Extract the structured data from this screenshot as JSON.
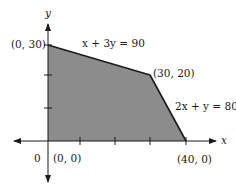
{
  "diagram": {
    "type": "feasible-region",
    "axes": {
      "x_label": "x",
      "y_label": "y",
      "origin_label": "0"
    },
    "vertices": [
      {
        "label": "(0, 0)",
        "x": 0,
        "y": 0
      },
      {
        "label": "(0, 30)",
        "x": 0,
        "y": 30
      },
      {
        "label": "(30, 20)",
        "x": 30,
        "y": 20
      },
      {
        "label": "(40, 0)",
        "x": 40,
        "y": 0
      }
    ],
    "constraints": [
      {
        "equation": "x + 3y = 90"
      },
      {
        "equation": "2x + y = 80"
      }
    ],
    "colors": {
      "region": "#8c8c8c",
      "lines": "#1a1a1a"
    }
  }
}
